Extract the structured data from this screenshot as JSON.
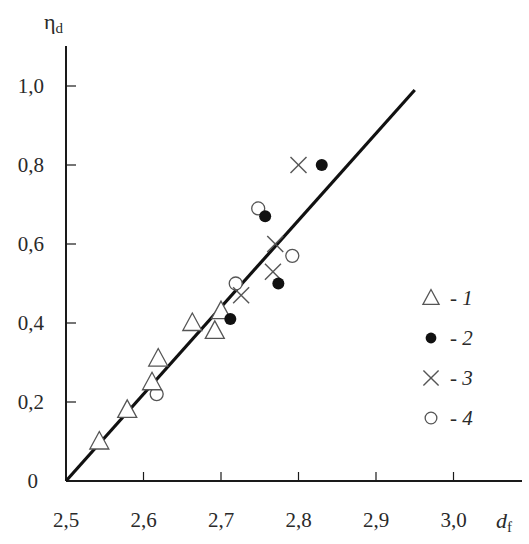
{
  "chart_data": {
    "type": "scatter",
    "title": "",
    "xlabel": "d_f",
    "ylabel": "η_d",
    "xlabel_main": "d",
    "xlabel_sub": "f",
    "ylabel_main": "η",
    "ylabel_sub": "d",
    "xlim": [
      2.5,
      3.07
    ],
    "ylim": [
      0,
      1.1
    ],
    "x_ticks": [
      2.5,
      2.6,
      2.7,
      2.8,
      2.9,
      3.0
    ],
    "x_tick_labels": [
      "2,5",
      "2,6",
      "2,7",
      "2,8",
      "2,9",
      "3,0"
    ],
    "y_ticks": [
      0,
      0.2,
      0.4,
      0.6,
      0.8,
      1.0
    ],
    "y_tick_labels": [
      "0",
      "0,2",
      "0,4",
      "0,6",
      "0,8",
      "1,0"
    ],
    "grid": false,
    "legend_position": "right-middle",
    "fit_line": {
      "x": [
        2.5,
        2.95
      ],
      "y": [
        0.0,
        0.99
      ]
    },
    "series": [
      {
        "name": "1",
        "marker": "open-triangle",
        "x": [
          2.543,
          2.579,
          2.611,
          2.619,
          2.663,
          2.692,
          2.7
        ],
        "y": [
          0.1,
          0.18,
          0.25,
          0.31,
          0.4,
          0.38,
          0.43
        ]
      },
      {
        "name": "2",
        "marker": "filled-circle",
        "x": [
          2.712,
          2.757,
          2.774,
          2.83
        ],
        "y": [
          0.41,
          0.67,
          0.5,
          0.8
        ]
      },
      {
        "name": "3",
        "marker": "cross",
        "x": [
          2.726,
          2.767,
          2.77,
          2.8
        ],
        "y": [
          0.47,
          0.53,
          0.6,
          0.8
        ]
      },
      {
        "name": "4",
        "marker": "open-circle",
        "x": [
          2.617,
          2.719,
          2.748,
          2.792
        ],
        "y": [
          0.22,
          0.5,
          0.69,
          0.57
        ]
      }
    ],
    "legend": [
      {
        "marker": "open-triangle",
        "label": "- 1"
      },
      {
        "marker": "filled-circle",
        "label": "- 2"
      },
      {
        "marker": "cross",
        "label": "- 3"
      },
      {
        "marker": "open-circle",
        "label": "- 4"
      }
    ]
  },
  "colors": {
    "axis": "#1a1a1a",
    "marker": "#555555",
    "filled": "#111111",
    "line": "#111111"
  }
}
